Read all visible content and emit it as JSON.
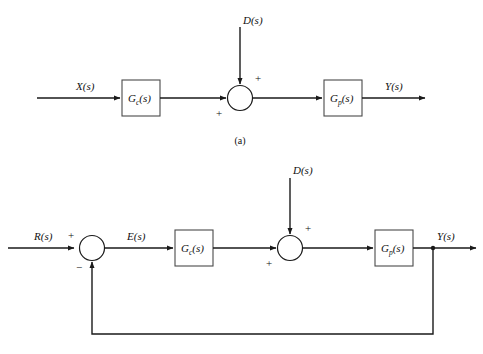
{
  "figure": {
    "background_color": "#ffffff",
    "line_color": "#1a1a1a",
    "box_stroke_color": "#4a4a4a",
    "caption_a": "(a)"
  },
  "diagram_a": {
    "name": "open-loop-with-disturbance",
    "input_label": "X",
    "input_arg": "(s)",
    "disturbance_label": "D",
    "disturbance_arg": "(s)",
    "output_label": "Y",
    "output_arg": "(s)",
    "controller_block": {
      "base": "G",
      "sub": "c",
      "arg": "(s)"
    },
    "plant_block": {
      "base": "G",
      "sub": "p",
      "arg": "(s)"
    },
    "summing_junction": {
      "sign_top": "+",
      "sign_left": "+"
    }
  },
  "diagram_b": {
    "name": "closed-loop-with-disturbance",
    "input_label": "R",
    "input_arg": "(s)",
    "error_label": "E",
    "error_arg": "(s)",
    "disturbance_label": "D",
    "disturbance_arg": "(s)",
    "output_label": "Y",
    "output_arg": "(s)",
    "controller_block": {
      "base": "G",
      "sub": "c",
      "arg": "(s)"
    },
    "plant_block": {
      "base": "G",
      "sub": "p",
      "arg": "(s)"
    },
    "comparator_junction": {
      "sign_top": "+",
      "sign_bottom": "−"
    },
    "summing_junction": {
      "sign_top": "+",
      "sign_left": "+"
    }
  }
}
